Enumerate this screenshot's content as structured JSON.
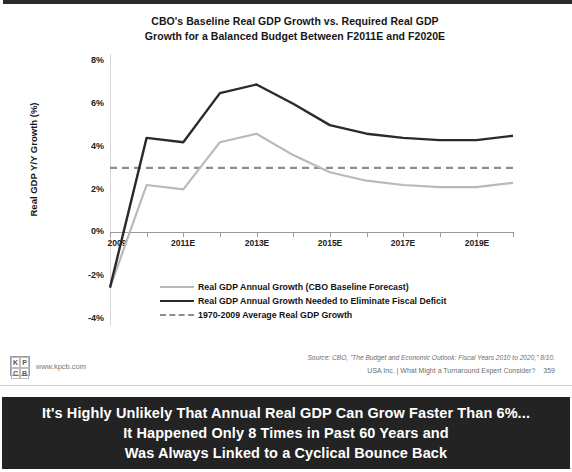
{
  "slide": {
    "banner": {
      "lines": [
        "It's Highly Unlikely That Annual Real GDP Can Grow Faster Than 6%...",
        "It Happened Only 8 Times in Past 60 Years and",
        "Was Always Linked to a Cyclical Bounce Back"
      ]
    },
    "footer": {
      "source": "Source: CBO, \"The Budget and Economic Outlook: Fiscal Years 2010 to 2020,\" 8/10.",
      "deck": "USA Inc. | What Might a Turnaround Expert Consider?",
      "page_number": "359",
      "logo_letters": [
        "K",
        "P",
        "C",
        "B"
      ],
      "logo_url": "www.kpcb.com"
    }
  },
  "chart_data": {
    "type": "line",
    "title_line1": "CBO's Baseline Real GDP Growth vs. Required Real GDP",
    "title_line2": "Growth for a Balanced Budget Between F2011E and F2020E",
    "xlabel": "",
    "ylabel": "Real GDP Y/Y Growth (%)",
    "ylim": [
      -4,
      8
    ],
    "yticks": [
      "8%",
      "6%",
      "4%",
      "2%",
      "0%",
      "-2%",
      "-4%"
    ],
    "ytick_values": [
      8,
      6,
      4,
      2,
      0,
      -2,
      -4
    ],
    "x": [
      2009,
      2010,
      2011,
      2012,
      2013,
      2014,
      2015,
      2016,
      2017,
      2018,
      2019,
      2020
    ],
    "xtick_labels": [
      "2009",
      "2011E",
      "2013E",
      "2015E",
      "2017E",
      "2019E"
    ],
    "xtick_values": [
      2009,
      2011,
      2013,
      2015,
      2017,
      2019
    ],
    "grid": false,
    "legend_position": "below-axes",
    "series": [
      {
        "name": "Real GDP Annual Growth (CBO Baseline Forecast)",
        "color": "#b9b9b9",
        "style": "solid",
        "values": [
          -2.6,
          2.2,
          2.0,
          4.2,
          4.6,
          3.6,
          2.8,
          2.4,
          2.2,
          2.1,
          2.1,
          2.3
        ]
      },
      {
        "name": "Real GDP Annual Growth Needed to Eliminate Fiscal Deficit",
        "color": "#2a2a2a",
        "style": "solid",
        "values": [
          -2.6,
          4.4,
          4.2,
          6.5,
          6.9,
          6.0,
          5.0,
          4.6,
          4.4,
          4.3,
          4.3,
          4.5
        ]
      },
      {
        "name": "1970-2009 Average Real GDP Growth",
        "color": "#8e8e8e",
        "style": "dashed",
        "values": [
          3.0,
          3.0,
          3.0,
          3.0,
          3.0,
          3.0,
          3.0,
          3.0,
          3.0,
          3.0,
          3.0,
          3.0
        ]
      }
    ]
  }
}
